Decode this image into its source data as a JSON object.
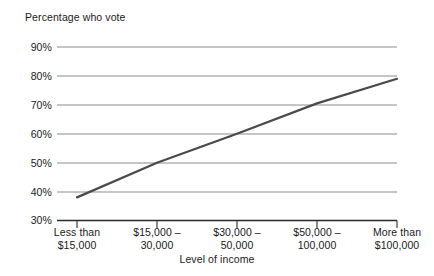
{
  "chart_data": {
    "type": "line",
    "title": "",
    "ylabel": "Percentage who vote",
    "xlabel": "Level of income",
    "categories": [
      "Less than $15,000",
      "$15,000 – 30,000",
      "$30,000 – 50,000",
      "$50,000 – 100,000",
      "More than $100,000"
    ],
    "category_lines": [
      [
        "Less than",
        "$15,000"
      ],
      [
        "$15,000 –",
        "30,000"
      ],
      [
        "$30,000 –",
        "50,000"
      ],
      [
        "$50,000 –",
        "100,000"
      ],
      [
        "More than",
        "$100,000"
      ]
    ],
    "values": [
      38,
      50,
      60,
      70.5,
      79
    ],
    "ylim": [
      30,
      90
    ],
    "ytick_labels": [
      "90%",
      "80%",
      "70%",
      "60%",
      "50%",
      "40%",
      "30%"
    ],
    "ytick_values": [
      90,
      80,
      70,
      60,
      50,
      40,
      30
    ],
    "grid": true,
    "legend": "none",
    "series": [
      {
        "name": "Percentage who vote",
        "values": [
          38,
          50,
          60,
          70.5,
          79
        ],
        "color": "#4a4a4a"
      }
    ],
    "colors": {
      "line": "#4a4a4a",
      "grid": "#8c8c8c",
      "axis": "#1a1a1a",
      "background": "#ffffff",
      "text": "#1a1a1a"
    }
  }
}
